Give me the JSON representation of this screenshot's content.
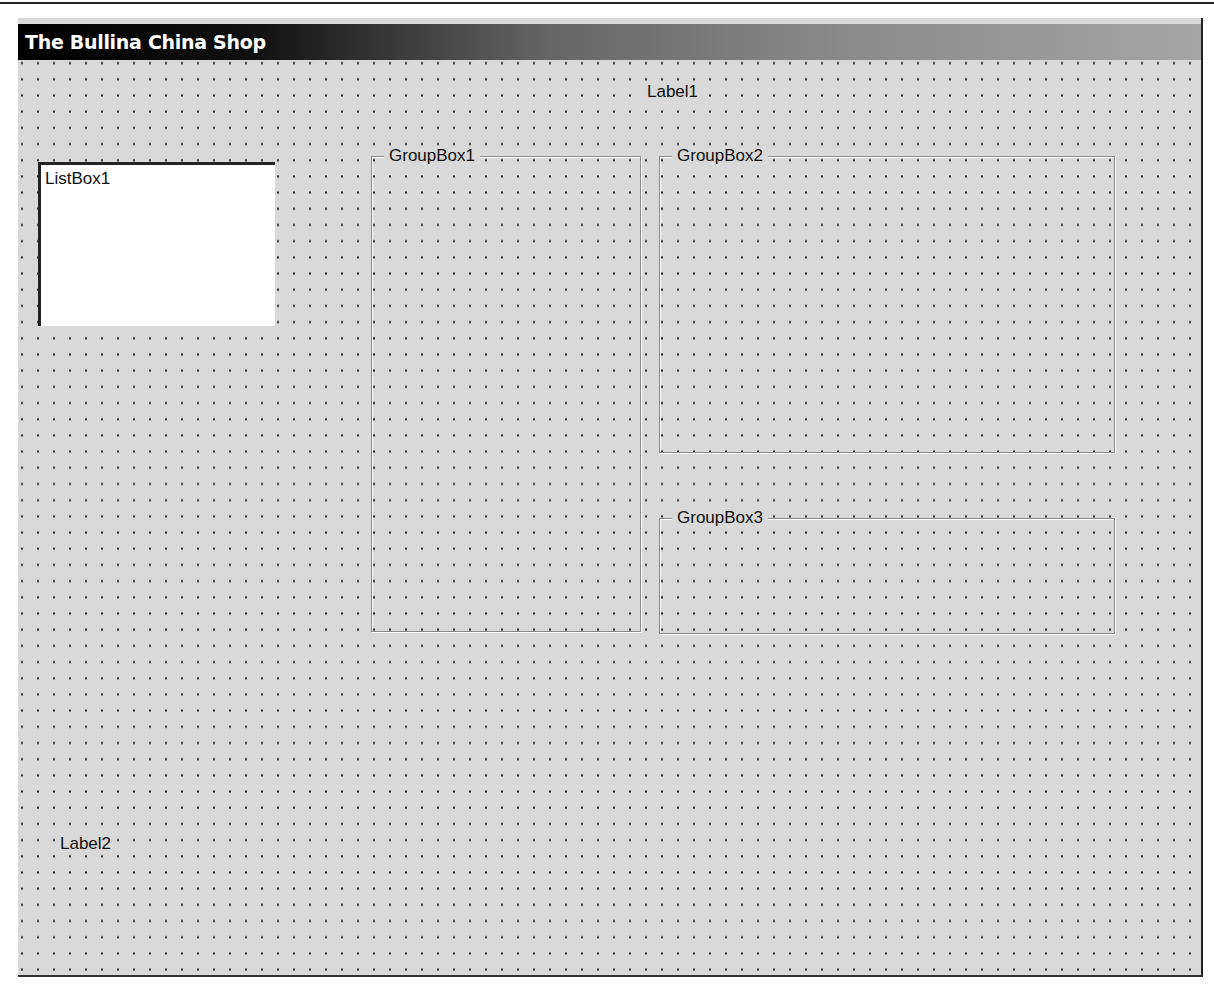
{
  "window": {
    "title": "The Bullina China Shop"
  },
  "form": {
    "background_color": "#d9d9d9",
    "grid": {
      "dot_spacing_px": 16,
      "dot_color": "#222222"
    },
    "labels": [
      {
        "id": "label1",
        "text": "Label1"
      },
      {
        "id": "label2",
        "text": "Label2"
      }
    ],
    "listbox": {
      "id": "listbox1",
      "text": "ListBox1"
    },
    "groupboxes": [
      {
        "id": "groupbox1",
        "caption": "GroupBox1"
      },
      {
        "id": "groupbox2",
        "caption": "GroupBox2"
      },
      {
        "id": "groupbox3",
        "caption": "GroupBox3"
      }
    ]
  }
}
